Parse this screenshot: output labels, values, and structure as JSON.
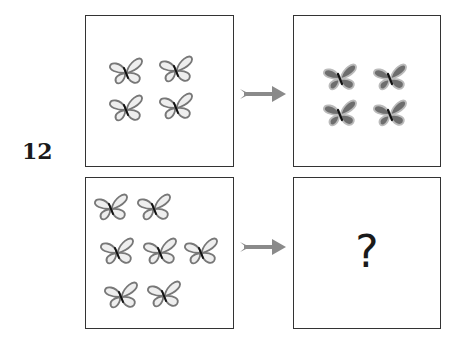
{
  "puzzle": {
    "number": "12",
    "question_mark": "?",
    "colors": {
      "outline_butterfly_fill": "#eeeeee",
      "outline_butterfly_stroke": "#777777",
      "filled_butterfly_fill": "#6e6e6e",
      "filled_butterfly_stroke": "#aaaaaa",
      "arrow": "#8a8a8a",
      "border": "#333333"
    },
    "panels": [
      {
        "name": "top-left",
        "description": "4 outlined (light) butterflies",
        "count": 4,
        "style": "outline"
      },
      {
        "name": "top-right",
        "description": "4 filled (dark) butterflies",
        "count": 4,
        "style": "filled"
      },
      {
        "name": "bottom-left",
        "description": "7 outlined (light) butterflies",
        "count": 7,
        "style": "outline"
      },
      {
        "name": "bottom-right",
        "description": "unknown answer",
        "content": "?"
      }
    ]
  }
}
